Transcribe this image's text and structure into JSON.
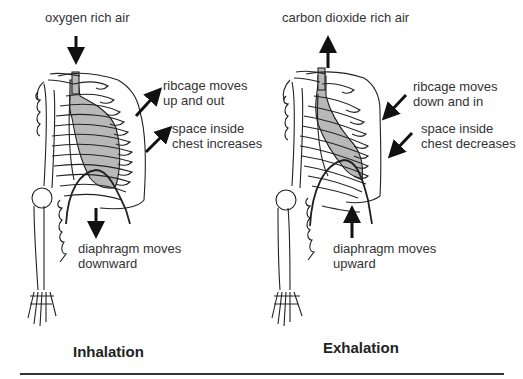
{
  "inhalation": {
    "title": "Inhalation",
    "air_label": "oxygen rich air",
    "ribcage_label": [
      "ribcage moves",
      "up and out"
    ],
    "space_label": [
      "space inside",
      "chest increases"
    ],
    "diaphragm_label": [
      "diaphragm moves",
      "downward"
    ],
    "air_arrow": "down-arrow",
    "ribcage_arrow": "arrow-up-right",
    "space_arrow": "arrow-up-right",
    "diaphragm_arrow": "down-arrow"
  },
  "exhalation": {
    "title": "Exhalation",
    "air_label": "carbon dioxide rich air",
    "ribcage_label": [
      "ribcage moves",
      "down and in"
    ],
    "space_label": [
      "space inside",
      "chest decreases"
    ],
    "diaphragm_label": [
      "diaphragm moves",
      "upward"
    ],
    "air_arrow": "up-arrow",
    "ribcage_arrow": "arrow-down-left",
    "space_arrow": "arrow-down-left",
    "diaphragm_arrow": "up-arrow"
  },
  "colors": {
    "lung_fill": "#b8b8b8",
    "line": "#222222",
    "background": "#ffffff"
  }
}
